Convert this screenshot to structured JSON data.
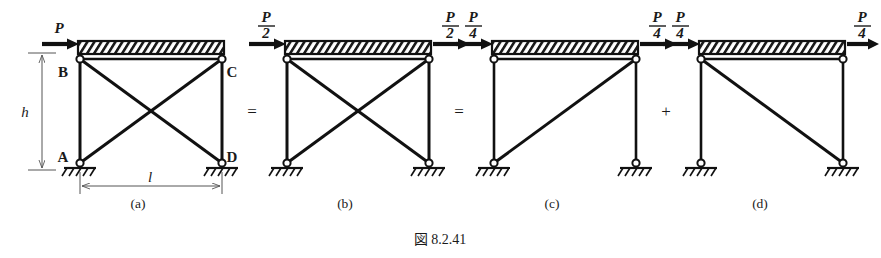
{
  "figure": {
    "caption": "図 8.2.41",
    "caption_prefix": "図",
    "caption_number": "8.2.41",
    "operators": [
      {
        "name": "equals-1",
        "symbol": "=",
        "x": 252,
        "y": 112
      },
      {
        "name": "equals-2",
        "symbol": "=",
        "x": 459,
        "y": 112
      },
      {
        "name": "plus-1",
        "symbol": "+",
        "x": 666,
        "y": 112
      }
    ]
  },
  "panels": [
    {
      "id": "a",
      "label": "(a)",
      "label_x": 138,
      "label_y": 205,
      "geometry": {
        "x_left": 80,
        "x_right": 222,
        "y_top": 59,
        "y_bottom": 163
      },
      "nodes": [
        {
          "name": "B",
          "label": "B",
          "x": 80,
          "y": 59,
          "label_x": 63,
          "label_y": 77
        },
        {
          "name": "C",
          "label": "C",
          "x": 222,
          "y": 59,
          "label_x": 228,
          "label_y": 77
        },
        {
          "name": "A",
          "label": "A",
          "x": 80,
          "y": 163,
          "label_x": 62,
          "label_y": 162
        },
        {
          "name": "D",
          "label": "D",
          "x": 222,
          "y": 163,
          "label_x": 228,
          "label_y": 162
        }
      ],
      "diagonals": [
        "both"
      ],
      "forces": [
        {
          "name": "force-P-left",
          "numerator": "P",
          "denominator": "",
          "text": "P",
          "arrow_x1": 42,
          "arrow_x2": 76,
          "arrow_y": 44,
          "label_x": 59,
          "label_y": 32,
          "direction": "right"
        }
      ],
      "dimensions": [
        {
          "name": "height-dimension",
          "label": "h",
          "label_x": 26,
          "label_y": 116,
          "orientation": "vertical",
          "x": 42,
          "y1": 53,
          "y2": 170
        },
        {
          "name": "span-dimension",
          "label": "l",
          "label_x": 148,
          "label_y": 181,
          "orientation": "horizontal",
          "y": 186,
          "x1": 80,
          "x2": 222
        }
      ],
      "supports": [
        {
          "name": "support-A",
          "type": "pin-hatched",
          "x": 80,
          "y": 163
        },
        {
          "name": "support-D",
          "type": "pin-hatched",
          "x": 222,
          "y": 163
        }
      ]
    },
    {
      "id": "b",
      "label": "(b)",
      "label_x": 340,
      "label_y": 205,
      "geometry": {
        "x_left": 287,
        "x_right": 429,
        "y_top": 59,
        "y_bottom": 163
      },
      "nodes": [],
      "diagonals": [
        "both"
      ],
      "forces": [
        {
          "name": "force-P-over-2-left",
          "numerator": "P",
          "denominator": "2",
          "text": "P/2",
          "arrow_x1": 249,
          "arrow_x2": 283,
          "arrow_y": 44,
          "label_x": 266,
          "label_y": 24,
          "direction": "right"
        },
        {
          "name": "force-P-over-2-right",
          "numerator": "P",
          "denominator": "2",
          "text": "P/2",
          "arrow_x1": 433,
          "arrow_x2": 467,
          "arrow_y": 44,
          "label_x": 450,
          "label_y": 24,
          "direction": "right"
        }
      ],
      "dimensions": [],
      "supports": [
        {
          "name": "support-b-left",
          "type": "pin-hatched",
          "x": 287,
          "y": 163
        },
        {
          "name": "support-b-right",
          "type": "pin-hatched",
          "x": 429,
          "y": 163
        }
      ]
    },
    {
      "id": "c",
      "label": "(c)",
      "label_x": 547,
      "label_y": 205,
      "geometry": {
        "x_left": 494,
        "x_right": 636,
        "y_top": 59,
        "y_bottom": 163
      },
      "nodes": [],
      "diagonals": [
        "bottom-left-to-top-right"
      ],
      "forces": [
        {
          "name": "force-P-over-4-c-left",
          "numerator": "P",
          "denominator": "4",
          "text": "P/4",
          "arrow_x1": 456,
          "arrow_x2": 490,
          "arrow_y": 44,
          "label_x": 473,
          "label_y": 24,
          "direction": "right"
        },
        {
          "name": "force-P-over-4-c-right",
          "numerator": "P",
          "denominator": "4",
          "text": "P/4",
          "arrow_x1": 640,
          "arrow_x2": 674,
          "arrow_y": 44,
          "label_x": 657,
          "label_y": 24,
          "direction": "right"
        }
      ],
      "dimensions": [],
      "supports": [
        {
          "name": "support-c-left",
          "type": "pin-hatched",
          "x": 494,
          "y": 163
        },
        {
          "name": "support-c-right",
          "type": "pin-hatched",
          "x": 636,
          "y": 163
        }
      ]
    },
    {
      "id": "d",
      "label": "(d)",
      "label_x": 754,
      "label_y": 205,
      "geometry": {
        "x_left": 701,
        "x_right": 843,
        "y_top": 59,
        "y_bottom": 163
      },
      "nodes": [],
      "diagonals": [
        "top-left-to-bottom-right"
      ],
      "forces": [
        {
          "name": "force-P-over-4-d-left",
          "numerator": "P",
          "denominator": "4",
          "text": "P/4",
          "arrow_x1": 663,
          "arrow_x2": 697,
          "arrow_y": 44,
          "label_x": 680,
          "label_y": 24,
          "direction": "right"
        },
        {
          "name": "force-P-over-4-d-right",
          "numerator": "P",
          "denominator": "4",
          "text": "P/4",
          "arrow_x1": 847,
          "arrow_x2": 878,
          "arrow_y": 44,
          "label_x": 862,
          "label_y": 24,
          "direction": "right"
        }
      ],
      "dimensions": [],
      "supports": [
        {
          "name": "support-d-left",
          "type": "pin-hatched",
          "x": 701,
          "y": 163
        },
        {
          "name": "support-d-right",
          "type": "pin-hatched",
          "x": 843,
          "y": 163
        }
      ]
    }
  ],
  "colors": {
    "ink": "#1a1a1a",
    "line": "#111111",
    "dimension": "#555555",
    "background": "#ffffff"
  }
}
